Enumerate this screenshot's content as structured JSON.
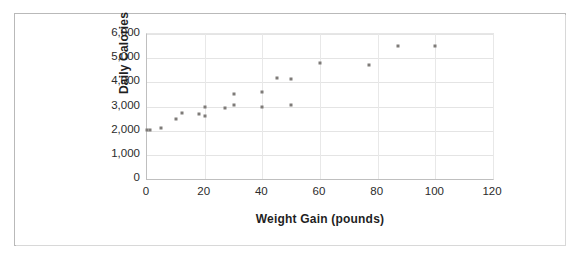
{
  "chart_data": {
    "type": "scatter",
    "title": "",
    "xlabel": "Weight Gain (pounds)",
    "ylabel": "Daily Calories",
    "xlim": [
      0,
      120
    ],
    "ylim": [
      0,
      6000
    ],
    "xticks": [
      "0",
      "20",
      "40",
      "60",
      "80",
      "100",
      "120"
    ],
    "xtick_values": [
      0,
      20,
      40,
      60,
      80,
      100,
      120
    ],
    "yticks": [
      "0",
      "1,000",
      "2,000",
      "3,000",
      "4,000",
      "5,000",
      "6,000"
    ],
    "ytick_values": [
      0,
      1000,
      2000,
      3000,
      4000,
      5000,
      6000
    ],
    "grid": "horizontal-and-vertical",
    "legend": "none",
    "marker_color": "#7e7b78",
    "gridline_color": "#e4e4e4",
    "axis_color": "#bfbfbf",
    "border_color": "#b9b9b9",
    "points": [
      {
        "x": 0,
        "y": 2025
      },
      {
        "x": 1,
        "y": 2025
      },
      {
        "x": 5,
        "y": 2100
      },
      {
        "x": 10,
        "y": 2500
      },
      {
        "x": 12,
        "y": 2720
      },
      {
        "x": 18,
        "y": 2700
      },
      {
        "x": 20,
        "y": 2620
      },
      {
        "x": 20,
        "y": 3000
      },
      {
        "x": 27,
        "y": 2940
      },
      {
        "x": 30,
        "y": 3080
      },
      {
        "x": 30,
        "y": 3520
      },
      {
        "x": 40,
        "y": 3000
      },
      {
        "x": 40,
        "y": 3620
      },
      {
        "x": 45,
        "y": 4200
      },
      {
        "x": 50,
        "y": 3070
      },
      {
        "x": 50,
        "y": 4120
      },
      {
        "x": 60,
        "y": 4820
      },
      {
        "x": 77,
        "y": 4720
      },
      {
        "x": 87,
        "y": 5500
      },
      {
        "x": 100,
        "y": 5500
      }
    ]
  }
}
